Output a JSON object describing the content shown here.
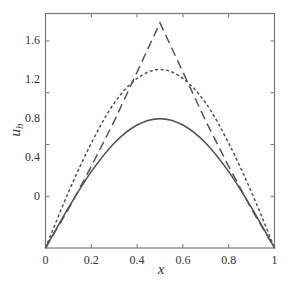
{
  "chart_data": {
    "type": "line",
    "title": "",
    "xlabel": "x",
    "ylabel": "u_h",
    "xlim": [
      0,
      1
    ],
    "ylim": [
      0,
      1.87
    ],
    "grid": false,
    "legend": null,
    "x_ticks": [
      0,
      0.2,
      0.4,
      0.6,
      0.8,
      1
    ],
    "x_tick_labels": [
      "0",
      "0.2",
      "0.4",
      "0.6",
      "0.8",
      "1"
    ],
    "y_ticks": [
      0,
      0.4,
      0.8,
      1.2,
      1.6
    ],
    "y_tick_labels": [
      "",
      "0",
      "0.4",
      "0.8",
      "1.2",
      "1.6"
    ],
    "y_tick_label_note": "Left-axis labels as rendered in the image: 0, 0.4, 0.8, 1.2, 1.6 (bottom tick unlabeled)",
    "series": [
      {
        "name": "solid",
        "style": "solid",
        "x": [
          0,
          0.1,
          0.2,
          0.3,
          0.4,
          0.5,
          0.6,
          0.7,
          0.8,
          0.9,
          1.0
        ],
        "values": [
          0,
          0.31,
          0.59,
          0.81,
          0.95,
          1.0,
          0.95,
          0.81,
          0.59,
          0.31,
          0
        ]
      },
      {
        "name": "dotted",
        "style": "dotted",
        "x": [
          0,
          0.1,
          0.2,
          0.3,
          0.4,
          0.5,
          0.6,
          0.7,
          0.8,
          0.9,
          1.0
        ],
        "values": [
          0,
          0.43,
          0.81,
          1.12,
          1.31,
          1.38,
          1.31,
          1.12,
          0.81,
          0.43,
          0
        ]
      },
      {
        "name": "long-dashed",
        "style": "dashed",
        "x": [
          0,
          0.1,
          0.2,
          0.3,
          0.4,
          0.5,
          0.6,
          0.7,
          0.8,
          0.9,
          1.0
        ],
        "values": [
          0,
          0.3,
          0.63,
          0.98,
          1.36,
          1.74,
          1.36,
          0.98,
          0.63,
          0.3,
          0
        ]
      }
    ]
  },
  "labels": {
    "xlabel": "x",
    "ylabel_main": "u",
    "ylabel_sub": "h"
  },
  "colors": {
    "axis": "#777777",
    "line": "#555555",
    "text": "#333333"
  }
}
